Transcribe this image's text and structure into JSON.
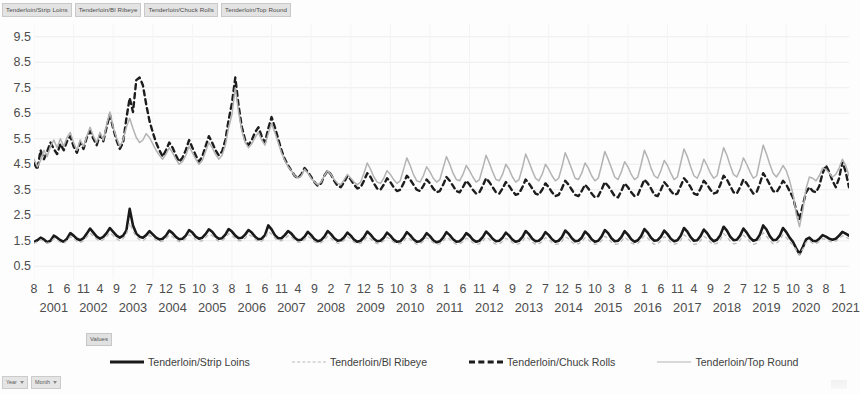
{
  "field_bar": {
    "buttons": [
      "Tenderloin/Strip Loins",
      "Tenderloin/Bl Ribeye",
      "Tenderloin/Chuck Rolls",
      "Tenderloin/Top Round"
    ]
  },
  "values_button": "Values",
  "bottom_bar": {
    "buttons": [
      "Year",
      "Month"
    ]
  },
  "legend": {
    "items": [
      {
        "label": "Tenderloin/Strip Loins",
        "style": "sw-solid-black"
      },
      {
        "label": "Tenderloin/Bl Ribeye",
        "style": "sw-dot-gray"
      },
      {
        "label": "Tenderloin/Chuck Rolls",
        "style": "sw-dash-black"
      },
      {
        "label": "Tenderloin/Top Round",
        "style": "sw-solid-gray"
      }
    ]
  },
  "chart_data": {
    "type": "line",
    "title": "",
    "xlabel": "Year / Month",
    "ylabel": "Values",
    "ylim": [
      0.0,
      10.0
    ],
    "yticks": [
      0.5,
      1.5,
      2.5,
      3.5,
      4.5,
      5.5,
      6.5,
      7.5,
      8.5,
      9.5
    ],
    "grid": true,
    "legend_position": "bottom",
    "x_start": {
      "year": 2001,
      "month": 8
    },
    "x_end": {
      "year": 2021,
      "month": 8
    },
    "years": [
      2001,
      2002,
      2003,
      2004,
      2005,
      2006,
      2007,
      2008,
      2009,
      2010,
      2011,
      2012,
      2013,
      2014,
      2015,
      2016,
      2017,
      2018,
      2019,
      2020,
      2021
    ],
    "month_tick_pattern": [
      8,
      1,
      6,
      11,
      4,
      9,
      2,
      7,
      12,
      5,
      10,
      3
    ],
    "colors": {
      "strip_loins": "#1a1a1a",
      "bl_ribeye": "#bcbcbc",
      "chuck_rolls": "#1d1d1d",
      "top_round": "#b3b3b3"
    },
    "series": [
      {
        "name": "Tenderloin/Strip Loins",
        "key": "strip_loins",
        "line": "solid",
        "width": 2.6,
        "values": [
          1.45,
          1.52,
          1.62,
          1.55,
          1.44,
          1.5,
          1.7,
          1.62,
          1.52,
          1.46,
          1.58,
          1.8,
          1.7,
          1.58,
          1.52,
          1.6,
          1.78,
          1.98,
          1.82,
          1.66,
          1.58,
          1.65,
          1.8,
          2.0,
          1.85,
          1.7,
          1.62,
          1.7,
          1.9,
          2.75,
          2.1,
          1.78,
          1.66,
          1.62,
          1.72,
          1.88,
          1.75,
          1.62,
          1.55,
          1.58,
          1.7,
          1.9,
          1.8,
          1.65,
          1.56,
          1.58,
          1.7,
          1.92,
          1.82,
          1.66,
          1.58,
          1.62,
          1.76,
          1.95,
          1.85,
          1.68,
          1.58,
          1.6,
          1.74,
          1.96,
          1.86,
          1.7,
          1.6,
          1.62,
          1.74,
          1.92,
          1.82,
          1.66,
          1.56,
          1.58,
          1.72,
          2.1,
          1.95,
          1.72,
          1.6,
          1.6,
          1.72,
          1.88,
          1.78,
          1.62,
          1.52,
          1.54,
          1.66,
          1.85,
          1.72,
          1.56,
          1.48,
          1.52,
          1.66,
          1.88,
          1.76,
          1.6,
          1.5,
          1.52,
          1.64,
          1.82,
          1.7,
          1.54,
          1.46,
          1.5,
          1.64,
          1.86,
          1.74,
          1.58,
          1.48,
          1.5,
          1.62,
          1.82,
          1.7,
          1.54,
          1.46,
          1.48,
          1.62,
          1.84,
          1.72,
          1.56,
          1.46,
          1.48,
          1.6,
          1.8,
          1.68,
          1.52,
          1.44,
          1.48,
          1.62,
          1.84,
          1.72,
          1.56,
          1.46,
          1.48,
          1.6,
          1.8,
          1.7,
          1.54,
          1.46,
          1.5,
          1.64,
          1.86,
          1.74,
          1.58,
          1.48,
          1.5,
          1.62,
          1.82,
          1.7,
          1.54,
          1.46,
          1.5,
          1.64,
          1.88,
          1.76,
          1.58,
          1.48,
          1.5,
          1.62,
          1.84,
          1.72,
          1.56,
          1.46,
          1.5,
          1.64,
          1.9,
          1.78,
          1.6,
          1.48,
          1.5,
          1.62,
          1.86,
          1.74,
          1.56,
          1.46,
          1.5,
          1.66,
          1.92,
          1.8,
          1.6,
          1.48,
          1.5,
          1.64,
          1.88,
          1.74,
          1.56,
          1.46,
          1.52,
          1.68,
          1.96,
          1.82,
          1.62,
          1.5,
          1.52,
          1.66,
          1.9,
          1.76,
          1.58,
          1.48,
          1.52,
          1.7,
          2.0,
          1.86,
          1.64,
          1.5,
          1.52,
          1.68,
          1.94,
          1.8,
          1.6,
          1.48,
          1.54,
          1.72,
          2.05,
          1.9,
          1.66,
          1.52,
          1.54,
          1.7,
          1.98,
          1.82,
          1.62,
          1.5,
          1.54,
          1.74,
          2.1,
          1.94,
          1.68,
          1.52,
          1.54,
          1.7,
          2.0,
          1.84,
          1.62,
          1.46,
          1.2,
          0.98,
          1.25,
          1.55,
          1.62,
          1.5,
          1.48,
          1.58,
          1.72,
          1.66,
          1.58,
          1.54,
          1.58,
          1.7,
          1.85,
          1.78,
          1.7
        ]
      },
      {
        "name": "Tenderloin/Bl Ribeye",
        "key": "bl_ribeye",
        "line": "dotted",
        "width": 1.3,
        "values": [
          1.4,
          1.46,
          1.54,
          1.48,
          1.4,
          1.44,
          1.58,
          1.52,
          1.44,
          1.4,
          1.5,
          1.66,
          1.58,
          1.48,
          1.42,
          1.5,
          1.64,
          1.8,
          1.68,
          1.56,
          1.48,
          1.54,
          1.66,
          1.82,
          1.7,
          1.58,
          1.5,
          1.58,
          1.74,
          2.2,
          1.88,
          1.64,
          1.54,
          1.5,
          1.6,
          1.72,
          1.62,
          1.52,
          1.46,
          1.48,
          1.58,
          1.72,
          1.66,
          1.54,
          1.46,
          1.48,
          1.58,
          1.74,
          1.66,
          1.54,
          1.48,
          1.5,
          1.62,
          1.76,
          1.7,
          1.56,
          1.48,
          1.5,
          1.6,
          1.78,
          1.7,
          1.58,
          1.5,
          1.5,
          1.6,
          1.74,
          1.68,
          1.56,
          1.46,
          1.48,
          1.58,
          1.86,
          1.76,
          1.6,
          1.5,
          1.5,
          1.58,
          1.7,
          1.64,
          1.52,
          1.44,
          1.44,
          1.54,
          1.68,
          1.58,
          1.46,
          1.4,
          1.42,
          1.52,
          1.68,
          1.6,
          1.48,
          1.4,
          1.42,
          1.52,
          1.66,
          1.56,
          1.44,
          1.38,
          1.4,
          1.5,
          1.66,
          1.58,
          1.46,
          1.38,
          1.4,
          1.5,
          1.64,
          1.56,
          1.44,
          1.38,
          1.38,
          1.48,
          1.64,
          1.56,
          1.44,
          1.36,
          1.38,
          1.48,
          1.62,
          1.54,
          1.42,
          1.36,
          1.38,
          1.48,
          1.64,
          1.56,
          1.44,
          1.36,
          1.38,
          1.46,
          1.6,
          1.54,
          1.42,
          1.36,
          1.38,
          1.48,
          1.64,
          1.56,
          1.44,
          1.36,
          1.38,
          1.46,
          1.6,
          1.52,
          1.42,
          1.36,
          1.38,
          1.48,
          1.66,
          1.58,
          1.44,
          1.36,
          1.38,
          1.46,
          1.62,
          1.54,
          1.42,
          1.36,
          1.38,
          1.48,
          1.66,
          1.58,
          1.44,
          1.36,
          1.38,
          1.46,
          1.62,
          1.54,
          1.42,
          1.36,
          1.38,
          1.5,
          1.68,
          1.58,
          1.44,
          1.36,
          1.38,
          1.48,
          1.64,
          1.54,
          1.42,
          1.36,
          1.4,
          1.52,
          1.7,
          1.6,
          1.46,
          1.36,
          1.38,
          1.5,
          1.66,
          1.56,
          1.44,
          1.36,
          1.4,
          1.52,
          1.74,
          1.62,
          1.46,
          1.36,
          1.38,
          1.5,
          1.68,
          1.58,
          1.44,
          1.36,
          1.4,
          1.54,
          1.78,
          1.66,
          1.48,
          1.38,
          1.4,
          1.52,
          1.72,
          1.6,
          1.46,
          1.36,
          1.4,
          1.56,
          1.82,
          1.68,
          1.5,
          1.38,
          1.4,
          1.52,
          1.74,
          1.62,
          1.46,
          1.34,
          1.14,
          0.94,
          1.18,
          1.44,
          1.5,
          1.4,
          1.38,
          1.46,
          1.58,
          1.54,
          1.48,
          1.44,
          1.48,
          1.58,
          1.7,
          1.64,
          1.58
        ]
      },
      {
        "name": "Tenderloin/Chuck Rolls",
        "key": "chuck_rolls",
        "line": "dashed",
        "width": 2.4,
        "values": [
          4.55,
          4.3,
          5.05,
          4.7,
          5.0,
          5.35,
          5.1,
          4.9,
          5.3,
          5.05,
          5.4,
          5.6,
          5.2,
          4.95,
          5.35,
          5.1,
          5.55,
          5.8,
          5.5,
          5.25,
          5.65,
          5.4,
          5.95,
          6.45,
          5.9,
          5.45,
          5.1,
          5.35,
          6.3,
          7.1,
          6.55,
          7.8,
          7.9,
          7.6,
          6.85,
          6.2,
          5.75,
          5.35,
          5.05,
          4.8,
          5.05,
          5.35,
          5.15,
          4.85,
          4.6,
          4.75,
          5.05,
          5.45,
          5.15,
          4.85,
          4.6,
          4.8,
          5.2,
          5.6,
          5.35,
          5.05,
          4.85,
          5.0,
          5.45,
          6.25,
          6.9,
          7.9,
          6.8,
          5.95,
          5.45,
          5.25,
          5.45,
          5.75,
          5.95,
          5.6,
          5.35,
          5.9,
          6.35,
          5.95,
          5.5,
          5.05,
          4.7,
          4.45,
          4.25,
          4.05,
          3.95,
          4.1,
          4.35,
          4.2,
          4.0,
          3.8,
          3.65,
          3.75,
          4.05,
          4.25,
          4.1,
          3.85,
          3.65,
          3.6,
          3.8,
          4.05,
          3.9,
          3.7,
          3.55,
          3.6,
          3.85,
          4.15,
          4.0,
          3.75,
          3.55,
          3.5,
          3.7,
          3.95,
          3.8,
          3.6,
          3.45,
          3.5,
          3.75,
          4.05,
          3.9,
          3.7,
          3.5,
          3.45,
          3.65,
          3.9,
          3.75,
          3.55,
          3.4,
          3.45,
          3.7,
          4.0,
          3.85,
          3.65,
          3.45,
          3.4,
          3.6,
          3.85,
          3.7,
          3.5,
          3.35,
          3.4,
          3.65,
          3.95,
          3.8,
          3.6,
          3.4,
          3.35,
          3.55,
          3.8,
          3.65,
          3.45,
          3.3,
          3.35,
          3.6,
          3.9,
          3.75,
          3.55,
          3.35,
          3.3,
          3.5,
          3.75,
          3.6,
          3.4,
          3.25,
          3.3,
          3.55,
          3.85,
          3.7,
          3.5,
          3.3,
          3.25,
          3.45,
          3.7,
          3.55,
          3.35,
          3.2,
          3.25,
          3.5,
          3.8,
          3.65,
          3.45,
          3.25,
          3.2,
          3.45,
          3.75,
          3.6,
          3.4,
          3.25,
          3.3,
          3.6,
          3.9,
          3.75,
          3.55,
          3.3,
          3.25,
          3.5,
          3.8,
          3.65,
          3.45,
          3.3,
          3.35,
          3.65,
          3.95,
          3.8,
          3.6,
          3.35,
          3.3,
          3.55,
          3.85,
          3.7,
          3.5,
          3.35,
          3.4,
          3.7,
          4.05,
          3.9,
          3.65,
          3.4,
          3.35,
          3.6,
          3.9,
          3.75,
          3.55,
          3.35,
          3.4,
          3.75,
          4.15,
          3.95,
          3.7,
          3.45,
          3.4,
          3.6,
          3.85,
          3.7,
          3.45,
          3.2,
          2.7,
          2.35,
          2.9,
          3.4,
          3.6,
          3.45,
          3.4,
          3.65,
          4.15,
          4.45,
          4.2,
          3.85,
          3.6,
          3.95,
          4.6,
          4.2,
          3.6
        ]
      },
      {
        "name": "Tenderloin/Top Round",
        "key": "top_round",
        "line": "solid",
        "width": 1.5,
        "values": [
          4.7,
          4.4,
          4.65,
          5.05,
          4.8,
          5.2,
          5.45,
          5.15,
          5.5,
          5.2,
          5.55,
          5.75,
          5.35,
          5.05,
          5.45,
          5.2,
          5.6,
          5.95,
          5.6,
          5.35,
          5.75,
          5.45,
          6.05,
          6.55,
          5.95,
          5.55,
          5.2,
          5.45,
          5.95,
          6.3,
          5.9,
          5.55,
          5.35,
          5.45,
          5.7,
          5.55,
          5.3,
          5.05,
          4.85,
          4.7,
          4.9,
          5.15,
          4.95,
          4.7,
          4.5,
          4.6,
          4.85,
          5.2,
          4.95,
          4.7,
          4.5,
          4.65,
          5.0,
          5.35,
          5.15,
          4.9,
          4.7,
          4.85,
          5.25,
          5.95,
          6.45,
          7.5,
          6.55,
          5.8,
          5.35,
          5.15,
          5.3,
          5.55,
          5.75,
          5.45,
          5.25,
          5.7,
          6.1,
          5.75,
          5.35,
          4.95,
          4.65,
          4.4,
          4.25,
          4.05,
          3.95,
          4.05,
          4.3,
          4.15,
          3.95,
          3.8,
          3.7,
          3.8,
          4.05,
          4.25,
          4.1,
          3.9,
          3.75,
          3.7,
          3.9,
          4.1,
          3.95,
          3.8,
          3.7,
          3.8,
          4.15,
          4.55,
          4.3,
          4.0,
          3.8,
          3.75,
          3.95,
          4.25,
          4.1,
          3.9,
          3.75,
          3.85,
          4.3,
          4.75,
          4.45,
          4.1,
          3.85,
          3.8,
          4.05,
          4.4,
          4.2,
          3.95,
          3.8,
          3.9,
          4.35,
          4.8,
          4.5,
          4.15,
          3.9,
          3.85,
          4.1,
          4.45,
          4.25,
          4.0,
          3.8,
          3.9,
          4.35,
          4.85,
          4.55,
          4.2,
          3.9,
          3.85,
          4.1,
          4.5,
          4.3,
          4.0,
          3.8,
          3.9,
          4.35,
          4.9,
          4.6,
          4.25,
          3.95,
          3.85,
          4.1,
          4.5,
          4.3,
          4.05,
          3.85,
          3.95,
          4.4,
          4.95,
          4.65,
          4.3,
          3.95,
          3.9,
          4.15,
          4.55,
          4.35,
          4.05,
          3.85,
          3.95,
          4.45,
          5.0,
          4.7,
          4.35,
          4.0,
          3.9,
          4.2,
          4.6,
          4.4,
          4.1,
          3.9,
          4.0,
          4.5,
          5.05,
          4.75,
          4.35,
          4.05,
          3.95,
          4.25,
          4.65,
          4.45,
          4.15,
          3.9,
          4.0,
          4.55,
          5.1,
          4.8,
          4.4,
          4.05,
          3.95,
          4.25,
          4.7,
          4.45,
          4.15,
          3.95,
          4.05,
          4.6,
          5.15,
          4.85,
          4.45,
          4.1,
          4.0,
          4.3,
          4.75,
          4.5,
          4.2,
          3.95,
          4.05,
          4.65,
          5.25,
          4.9,
          4.5,
          4.15,
          4.0,
          4.2,
          4.45,
          4.25,
          3.85,
          3.35,
          2.55,
          2.05,
          2.7,
          3.55,
          4.0,
          3.95,
          3.85,
          4.05,
          4.35,
          4.3,
          4.15,
          4.0,
          4.1,
          4.35,
          4.7,
          4.45,
          4.05
        ]
      }
    ]
  }
}
